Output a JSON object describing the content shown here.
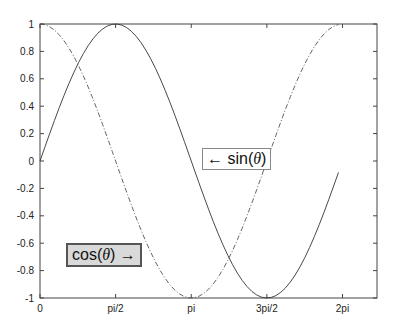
{
  "chart_data": {
    "type": "line",
    "title": "",
    "xlabel": "",
    "ylabel": "",
    "xlim": [
      0,
      7
    ],
    "ylim": [
      -1,
      1
    ],
    "grid": false,
    "x_ticks": [
      {
        "value": 0,
        "label": "0"
      },
      {
        "value": 1.5708,
        "label": "pi/2"
      },
      {
        "value": 3.1416,
        "label": "pi"
      },
      {
        "value": 4.7124,
        "label": "3pi/2"
      },
      {
        "value": 6.2832,
        "label": "2pi"
      }
    ],
    "y_ticks": [
      {
        "value": 1,
        "label": "1"
      },
      {
        "value": 0.8,
        "label": "0.8"
      },
      {
        "value": 0.6,
        "label": "0.6"
      },
      {
        "value": 0.4,
        "label": "0.4"
      },
      {
        "value": 0.2,
        "label": "0.2"
      },
      {
        "value": 0,
        "label": "0"
      },
      {
        "value": -0.2,
        "label": "-0.2"
      },
      {
        "value": -0.4,
        "label": "-0.4"
      },
      {
        "value": -0.6,
        "label": "-0.6"
      },
      {
        "value": -0.8,
        "label": "-0.8"
      },
      {
        "value": -1,
        "label": "-1"
      }
    ],
    "series": [
      {
        "name": "sin(θ)",
        "function": "sin",
        "x_range": [
          0,
          6.2
        ],
        "x_step": 0.1,
        "line_style": "solid",
        "color": "#333333"
      },
      {
        "name": "cos(θ)",
        "function": "cos",
        "x_range": [
          0,
          6.2
        ],
        "x_step": 0.1,
        "line_style": "dashdot",
        "color": "#555555"
      }
    ],
    "annotations": [
      {
        "text_prefix": "← sin(",
        "theta": "θ",
        "text_suffix": ")",
        "x": 3.6,
        "y": 0.0,
        "boxed": true,
        "box_fill": "#ffffff"
      },
      {
        "text_prefix": "cos(",
        "theta": "θ",
        "text_suffix": ") →",
        "x": 0.65,
        "y": -0.72,
        "boxed": true,
        "box_fill": "#d9d9d9"
      }
    ]
  }
}
